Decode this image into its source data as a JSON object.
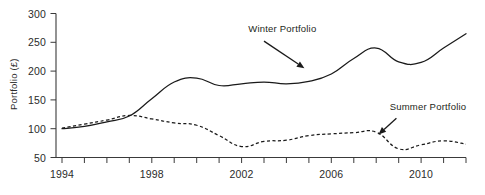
{
  "chart_data": {
    "type": "line",
    "title": "",
    "xlabel": "",
    "ylabel": "Portfolio (£)",
    "xlim": [
      1994,
      2012
    ],
    "ylim": [
      50,
      300
    ],
    "grid": false,
    "legend_position": "inline-annotations",
    "y_ticks": [
      50,
      100,
      150,
      200,
      250,
      300
    ],
    "y_tick_labels": [
      "50",
      "100",
      "150",
      "200",
      "250",
      "300"
    ],
    "x_ticks": [
      1994,
      1995,
      1996,
      1997,
      1998,
      1999,
      2000,
      2001,
      2002,
      2003,
      2004,
      2005,
      2006,
      2007,
      2008,
      2009,
      2010,
      2011,
      2012
    ],
    "x_tick_labels_shown": [
      "1994",
      "1998",
      "2002",
      "2006",
      "2010"
    ],
    "x_labelled_ticks": [
      1994,
      1998,
      2002,
      2006,
      2010
    ],
    "x": [
      1994,
      1995,
      1996,
      1997,
      1998,
      1999,
      2000,
      2001,
      2002,
      2003,
      2004,
      2005,
      2006,
      2007,
      2008,
      2009,
      2010,
      2011,
      2012
    ],
    "series": [
      {
        "name": "Winter Portfolio",
        "style": "solid",
        "values": [
          100,
          104,
          112,
          122,
          152,
          181,
          188,
          175,
          178,
          181,
          178,
          182,
          195,
          222,
          240,
          216,
          215,
          240,
          265
        ]
      },
      {
        "name": "Summer Portfolio",
        "style": "dashed",
        "values": [
          101,
          108,
          115,
          123,
          117,
          110,
          106,
          88,
          69,
          78,
          80,
          88,
          91,
          93,
          94,
          65,
          72,
          79,
          73
        ]
      }
    ],
    "annotations": [
      {
        "text": "Winter Portfolio",
        "target_series": "Winter Portfolio",
        "label_x": 2002.3,
        "label_y": 268,
        "arrow_from": [
          2003.0,
          252
        ],
        "arrow_to": [
          2004.8,
          205
        ]
      },
      {
        "text": "Summer Portfolio",
        "target_series": "Summer Portfolio",
        "label_x": 2008.6,
        "label_y": 133,
        "arrow_from": [
          2008.9,
          118
        ],
        "arrow_to": [
          2008.1,
          90
        ]
      }
    ],
    "colors": {
      "line": "#1a1a1a",
      "axis": "#3a3a3a",
      "text": "#2b2b2b",
      "background": "#ffffff"
    }
  }
}
